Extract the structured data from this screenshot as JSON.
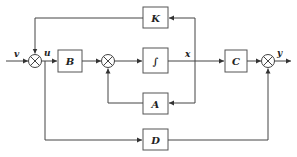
{
  "diagram": {
    "type": "state-space block diagram",
    "signals": {
      "input": "v",
      "control": "u",
      "state": "x",
      "output": "y"
    },
    "blocks": {
      "K": "K",
      "B": "B",
      "integrator": "∫",
      "C": "C",
      "A": "A",
      "D": "D"
    },
    "summing_junctions": [
      "sum-input",
      "sum-state",
      "sum-output"
    ],
    "colors": {
      "line": "#444444",
      "block_border": "#555555",
      "background": "#ffffff"
    }
  }
}
